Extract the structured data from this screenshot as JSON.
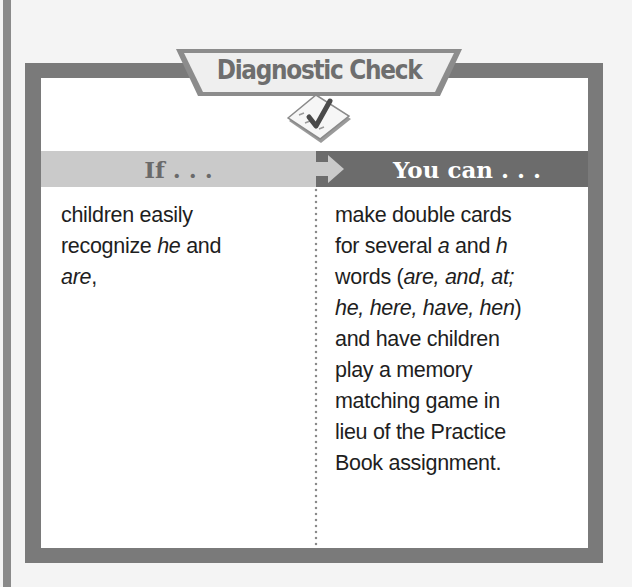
{
  "title": "Diagnostic Check",
  "icons": {
    "badge": "checklist-icon",
    "arrow": "arrow-right-icon"
  },
  "colors": {
    "frame": "#7a7a7a",
    "header_left": "#cacaca",
    "header_right": "#6c6c6c",
    "background": "#f4f4f4",
    "text": "#1e1e1e"
  },
  "table": {
    "headers": {
      "left": "If . . .",
      "right": "You can . . ."
    },
    "left_cell": {
      "lines": [
        [
          {
            "t": "children easily"
          }
        ],
        [
          {
            "t": "recognize "
          },
          {
            "t": "he",
            "i": true
          },
          {
            "t": " and"
          }
        ],
        [
          {
            "t": "are",
            "i": true
          },
          {
            "t": ","
          }
        ]
      ]
    },
    "right_cell": {
      "lines": [
        [
          {
            "t": "make double cards"
          }
        ],
        [
          {
            "t": "for several "
          },
          {
            "t": "a",
            "i": true
          },
          {
            "t": " and "
          },
          {
            "t": "h",
            "i": true
          }
        ],
        [
          {
            "t": "words ("
          },
          {
            "t": "are, and, at;",
            "i": true
          }
        ],
        [
          {
            "t": "he, here, have, hen",
            "i": true
          },
          {
            "t": ")"
          }
        ],
        [
          {
            "t": "and have children"
          }
        ],
        [
          {
            "t": "play a memory"
          }
        ],
        [
          {
            "t": "matching game in"
          }
        ],
        [
          {
            "t": "lieu of the Practice"
          }
        ],
        [
          {
            "t": "Book assignment."
          }
        ]
      ]
    }
  }
}
